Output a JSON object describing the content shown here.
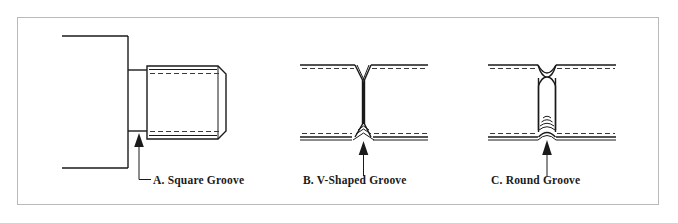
{
  "figure": {
    "background_color": "#ffffff",
    "frame_color": "#b9b9b9",
    "line_color": "#1a1a1a",
    "hidden_line_color": "#3a3a3a"
  },
  "panels": [
    {
      "id": "panel-a",
      "letter": "A.",
      "name": "Square Groove",
      "caption": "A. Square Groove",
      "groove_profile": "square",
      "has_leader_line": true,
      "has_arrow": true,
      "arrow_direction": "up"
    },
    {
      "id": "panel-b",
      "letter": "B.",
      "name": "V-Shaped Groove",
      "caption": "B. V-Shaped Groove",
      "groove_profile": "v-shaped",
      "has_leader_line": true,
      "has_arrow": true,
      "arrow_direction": "up"
    },
    {
      "id": "panel-c",
      "letter": "C.",
      "name": "Round Groove",
      "caption": "C. Round Groove",
      "groove_profile": "round",
      "has_leader_line": true,
      "has_arrow": true,
      "arrow_direction": "up"
    }
  ]
}
